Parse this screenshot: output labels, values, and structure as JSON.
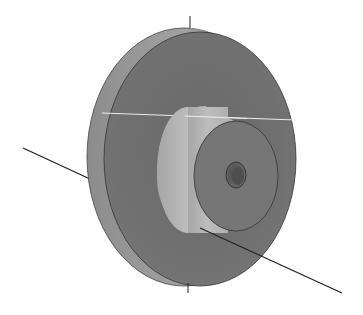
{
  "scene": {
    "title": "Flanged hub part (isometric view)",
    "colors": {
      "background": "#ffffff",
      "flange_rim": "#9a9a9a",
      "flange_face": "#6e6e6e",
      "hub_side": "#b4b4b4",
      "hub_face": "#777777",
      "bore": "#555555",
      "edge": "#333333",
      "axis": "#222222",
      "highlight_line": "#e8e8e8"
    },
    "parts": [
      {
        "name": "flange",
        "label": "Flange disc"
      },
      {
        "name": "hub",
        "label": "Cylindrical hub"
      },
      {
        "name": "bore",
        "label": "Center bore"
      }
    ],
    "axes": [
      {
        "name": "vertical-axis",
        "label": "Vertical axis"
      },
      {
        "name": "rotation-axis",
        "label": "Rotation axis"
      }
    ]
  }
}
